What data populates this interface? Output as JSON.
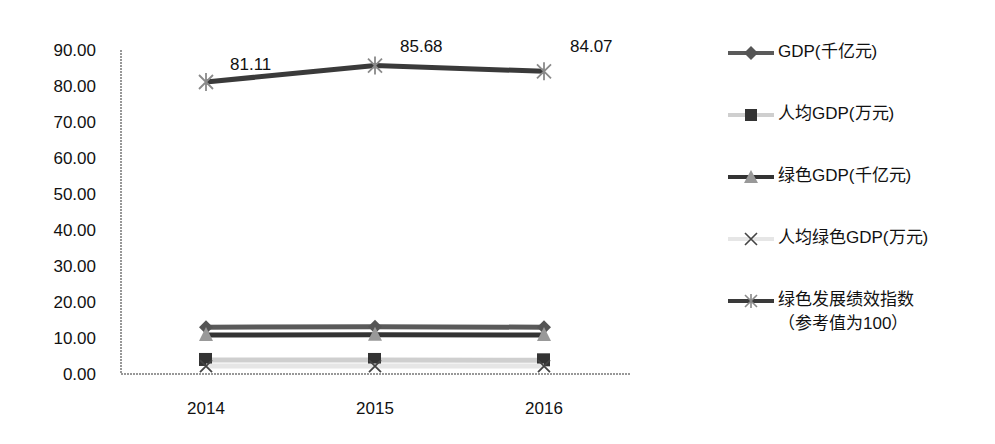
{
  "chart_data": {
    "type": "line",
    "title": "",
    "xlabel": "",
    "ylabel": "",
    "categories": [
      "2014",
      "2015",
      "2016"
    ],
    "ylim": [
      0,
      90
    ],
    "yticks": [
      "0.00",
      "10.00",
      "20.00",
      "30.00",
      "40.00",
      "50.00",
      "60.00",
      "70.00",
      "80.00",
      "90.00"
    ],
    "grid": false,
    "legend_position": "right",
    "series": [
      {
        "name": "GDP(千亿元)",
        "values": [
          13.0,
          13.1,
          13.0
        ],
        "color": "#5a5a5a",
        "marker": "diamond",
        "marker_color": "#555555",
        "data_labels": false
      },
      {
        "name": "人均GDP(万元)",
        "values": [
          3.9,
          3.9,
          3.8
        ],
        "color": "#cfcfcf",
        "marker": "square",
        "marker_color": "#333333",
        "data_labels": false
      },
      {
        "name": "绿色GDP(千亿元)",
        "values": [
          10.8,
          10.9,
          10.8
        ],
        "color": "#333333",
        "marker": "triangle",
        "marker_color": "#999999",
        "data_labels": false
      },
      {
        "name": "人均绿色GDP(万元)",
        "values": [
          2.2,
          2.2,
          2.2
        ],
        "color": "#e6e6e6",
        "marker": "x",
        "marker_color": "#444444",
        "data_labels": false
      },
      {
        "name": "绿色发展绩效指数\n（参考值为100）",
        "values": [
          81.11,
          85.68,
          84.07
        ],
        "color": "#3a3a3a",
        "marker": "star",
        "marker_color": "#8a8a8a",
        "data_labels": true,
        "labels": [
          "81.11",
          "85.68",
          "84.07"
        ]
      }
    ]
  },
  "legend": {
    "items": [
      {
        "label": "GDP(千亿元)"
      },
      {
        "label": "人均GDP(万元)"
      },
      {
        "label": "绿色GDP(千亿元)"
      },
      {
        "label": "人均绿色GDP(万元)"
      },
      {
        "label": "绿色发展绩效指数\n（参考值为100）"
      }
    ]
  }
}
